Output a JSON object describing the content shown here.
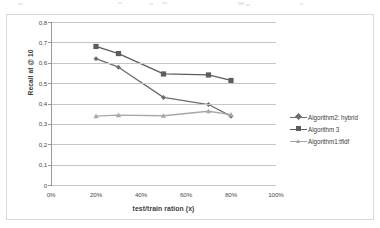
{
  "chart_data": {
    "type": "line",
    "title": "",
    "xlabel": "test/train ration (x)",
    "ylabel": "Recall at @ 10",
    "x": [
      20,
      30,
      50,
      70,
      80
    ],
    "xlim": [
      0,
      100
    ],
    "ylim": [
      0,
      0.8
    ],
    "grid": true,
    "legend_position": "right",
    "x_tick_labels": [
      "0%",
      "20%",
      "40%",
      "60%",
      "80%",
      "100%"
    ],
    "x_tick_values": [
      0,
      20,
      40,
      60,
      80,
      100
    ],
    "y_tick_labels": [
      "0",
      "0,1",
      "0,2",
      "0,3",
      "0,4",
      "0,5",
      "0,6",
      "0,7",
      "0,8"
    ],
    "y_tick_values": [
      0,
      0.1,
      0.2,
      0.3,
      0.4,
      0.5,
      0.6,
      0.7,
      0.8
    ],
    "series": [
      {
        "name": "Algorithm2: hybrid",
        "marker": "diamond",
        "color": "#6e6e6e",
        "values": [
          0.62,
          0.578,
          0.43,
          0.395,
          0.338
        ]
      },
      {
        "name": "Algorithm 3",
        "marker": "square",
        "color": "#5d5d5d",
        "values": [
          0.68,
          0.645,
          0.545,
          0.54,
          0.513
        ]
      },
      {
        "name": "Algorithm1:tfidf",
        "marker": "triangle",
        "color": "#a8a8a8",
        "values": [
          0.338,
          0.343,
          0.34,
          0.362,
          0.345
        ]
      }
    ]
  },
  "axes": {
    "y_title": "Recall at @ 10",
    "x_title": "test/train ration (x)",
    "y_labels": [
      "0,8",
      "0,7",
      "0,6",
      "0,5",
      "0,4",
      "0,3",
      "0,2",
      "0,1",
      "0"
    ],
    "x_labels": [
      "0%",
      "20%",
      "40%",
      "60%",
      "80%",
      "100%"
    ]
  },
  "legend": {
    "items": [
      {
        "label": "Algorithm2: hybrid",
        "marker": "diamond",
        "color": "#6e6e6e"
      },
      {
        "label": "Algorithm 3",
        "marker": "square",
        "color": "#5d5d5d"
      },
      {
        "label": "Algorithm1:tfidf",
        "marker": "triangle",
        "color": "#a8a8a8"
      }
    ]
  }
}
